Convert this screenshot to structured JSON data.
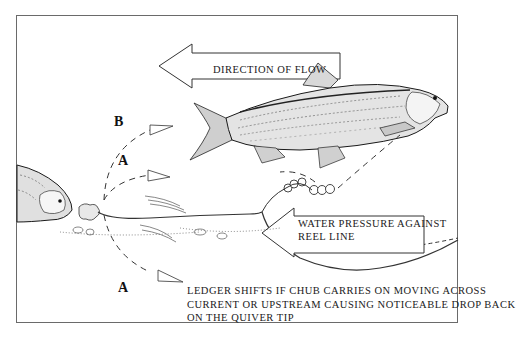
{
  "diagram": {
    "labels": {
      "direction_of_flow": "DIRECTION OF FLOW",
      "water_pressure_line1": "WATER PRESSURE AGAINST",
      "water_pressure_line2": "REEL LINE",
      "ledger_line1": "LEDGER SHIFTS IF CHUB CARRIES ON MOVING ACROSS",
      "ledger_line2": "CURRENT OR UPSTREAM CAUSING NOTICEABLE DROP BACK",
      "ledger_line3": "ON THE QUIVER TIP"
    },
    "path_markers": {
      "a_upper": "A",
      "a_lower": "A",
      "b": "B"
    },
    "arrow_tags": [
      "U",
      "L",
      "R"
    ],
    "elements": [
      "flow-arrow",
      "chub-swimming",
      "chub-feeding",
      "bait",
      "ledger-weight",
      "reel-line",
      "riverbed-weed"
    ],
    "colors": {
      "ink": "#1a1a1a",
      "frame": "#6a6a6a",
      "paper": "#ffffff"
    }
  }
}
